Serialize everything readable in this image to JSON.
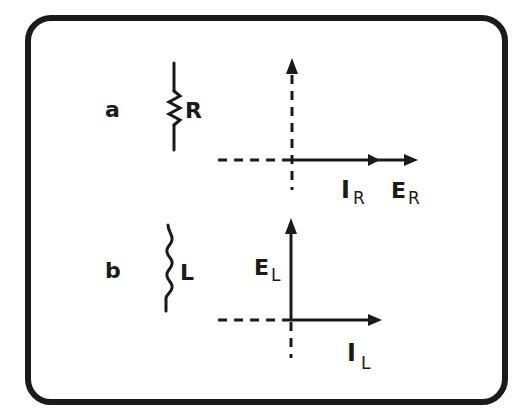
{
  "figure": {
    "panels": [
      {
        "id": "a",
        "label": "a",
        "component": "resistor",
        "component_label": "R",
        "phasors": [
          {
            "symbol": "I",
            "subscript": "R",
            "direction": "right"
          },
          {
            "symbol": "E",
            "subscript": "R",
            "direction": "right"
          }
        ],
        "note": "current and voltage in phase"
      },
      {
        "id": "b",
        "label": "b",
        "component": "inductor",
        "component_label": "L",
        "phasors": [
          {
            "symbol": "E",
            "subscript": "L",
            "direction": "up"
          },
          {
            "symbol": "I",
            "subscript": "L",
            "direction": "right"
          }
        ],
        "note": "voltage leads current by 90 degrees"
      }
    ]
  },
  "colors": {
    "ink": "#1a1a1a",
    "background": "#ffffff"
  }
}
